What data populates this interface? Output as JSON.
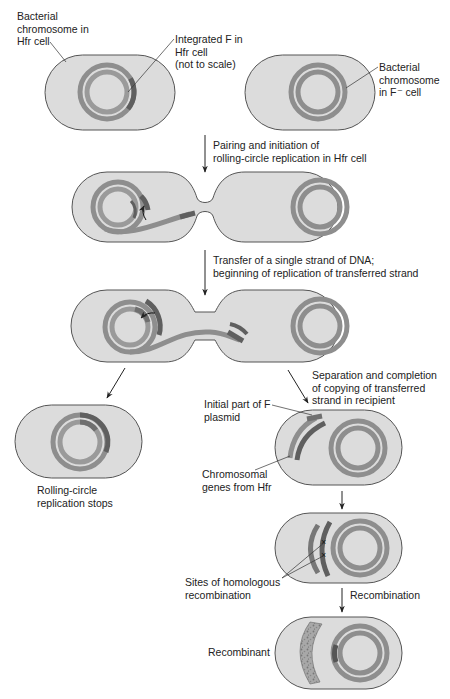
{
  "colors": {
    "cell_fill": "#dcdcdc",
    "cell_stroke": "#555555",
    "chromosome": "#8e8e8e",
    "chromosome_inner": "#9a9a9a",
    "f_factor": "#5f5f5f",
    "text": "#222222"
  },
  "labels": {
    "hfr_chromosome": [
      "Bacterial",
      "chromosome in",
      "Hfr cell"
    ],
    "integrated_f": [
      "Integrated F in",
      "Hfr cell",
      "(not to scale)"
    ],
    "f_minus_chromosome": [
      "Bacterial",
      "chromosome",
      "in F⁻ cell"
    ],
    "step1": [
      "Pairing and initiation of",
      "rolling-circle replication in Hfr cell"
    ],
    "step2": [
      "Transfer of a single strand of DNA;",
      "beginning of replication of transferred strand"
    ],
    "step3_left": [
      "Rolling-circle",
      "replication stops"
    ],
    "step3_right": [
      "Separation and completion",
      "of copying of transferred",
      "strand in recipient"
    ],
    "initial_f": [
      "Initial part of F",
      "plasmid"
    ],
    "chromosomal_genes": [
      "Chromosomal",
      "genes from Hfr"
    ],
    "sites_recombination": [
      "Sites of homologous",
      "recombination"
    ],
    "step4": [
      "Recombination"
    ],
    "recombinant": [
      "Recombinant"
    ]
  }
}
